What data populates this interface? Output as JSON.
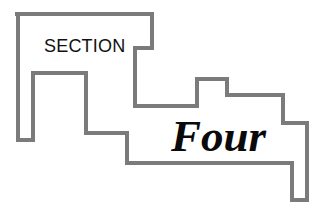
{
  "header": {
    "section_label": "SECTION",
    "section_number": "Four"
  },
  "colors": {
    "outline_stroke": "#7b7b7b",
    "background": "#ffffff",
    "text": "#111111"
  },
  "shape": {
    "outline_points": "15,14 152,14 152,48 135,48 135,106 197,106 197,79 227,79 227,95 283,95 283,123 307,123 307,200 292,200 292,163 127,163 127,133 86,133 86,73 33,73 33,140 18,140 18,14"
  }
}
